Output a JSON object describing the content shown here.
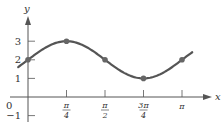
{
  "chart_data": {
    "type": "line",
    "title": "",
    "function": "y = 2 + sin(2x)",
    "xlabel": "x",
    "ylabel": "y",
    "xlim": [
      -0.25,
      3.4
    ],
    "ylim": [
      -1.3,
      3.6
    ],
    "grid": false,
    "legend": null,
    "x_ticks": [
      {
        "value": 0.7854,
        "num": "π",
        "den": "4"
      },
      {
        "value": 1.5708,
        "num": "π",
        "den": "2"
      },
      {
        "value": 2.3562,
        "num": "3π",
        "den": "4"
      },
      {
        "value": 3.1416,
        "num": "π",
        "den": ""
      }
    ],
    "y_ticks": [
      {
        "value": 3,
        "label": "3"
      },
      {
        "value": 2,
        "label": "2"
      },
      {
        "value": 1,
        "label": "1"
      },
      {
        "value": -1,
        "label": "−1"
      }
    ],
    "origin_label": "0",
    "series": [
      {
        "name": "2 + sin 2x",
        "x_range": [
          -0.2,
          3.35
        ],
        "marked_points": [
          {
            "x": 0,
            "y": 2
          },
          {
            "x": 0.7854,
            "y": 3
          },
          {
            "x": 1.5708,
            "y": 2
          },
          {
            "x": 2.3562,
            "y": 1
          },
          {
            "x": 3.1416,
            "y": 2
          }
        ]
      }
    ],
    "colors": {
      "curve": "#555555",
      "points": "#666666",
      "axes": "#555555",
      "text": "#333333"
    }
  }
}
